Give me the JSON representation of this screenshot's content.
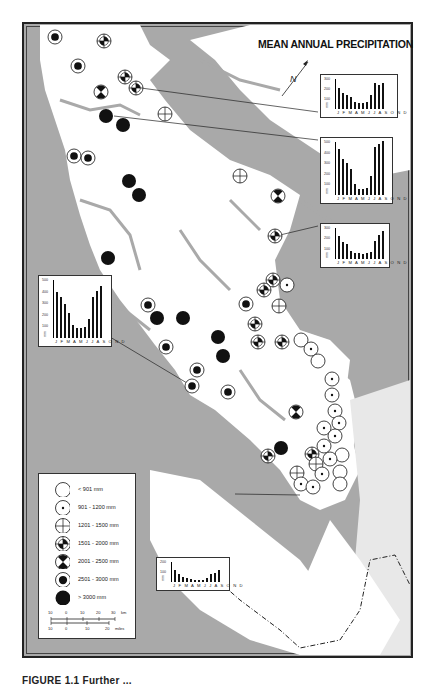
{
  "map": {
    "title": "MEAN ANNUAL PRECIPITATION",
    "caption": "FIGURE 1.1 Further ...",
    "north_arrow": "N",
    "colors": {
      "land": "#ffffff",
      "water": "#a9a9a9",
      "ink": "#111111"
    }
  },
  "legend": {
    "items": [
      {
        "symbol": "open-circle",
        "label": "< 901 mm"
      },
      {
        "symbol": "dot-circle",
        "label": "901 - 1200 mm"
      },
      {
        "symbol": "crosshair-circle",
        "label": "1201 - 1500 mm"
      },
      {
        "symbol": "quadrant-circle",
        "label": "1501 - 2000 mm"
      },
      {
        "symbol": "hourglass-circle",
        "label": "2001 - 2500 mm"
      },
      {
        "symbol": "ring-filled-circle",
        "label": "2501 - 3000 mm"
      },
      {
        "symbol": "solid-circle",
        "label": "> 3000 mm"
      }
    ],
    "scale": {
      "km_ticks": [
        "10",
        "0",
        "10",
        "20",
        "30"
      ],
      "km_unit": "km",
      "mile_ticks": [
        "10",
        "0",
        "10",
        "20"
      ],
      "mile_unit": "miles"
    }
  },
  "chart_data": [
    {
      "type": "bar",
      "title": "Climograph 1 (north coast station)",
      "categories": [
        "J",
        "F",
        "M",
        "A",
        "M",
        "J",
        "J",
        "A",
        "S",
        "O",
        "N",
        "D"
      ],
      "values": [
        210,
        160,
        140,
        120,
        70,
        65,
        60,
        70,
        140,
        260,
        240,
        265
      ],
      "ylabel": "mm",
      "yticks": [
        "100",
        "200",
        "300"
      ],
      "ylim": [
        0,
        300
      ],
      "month_labels": "J F M A M J J A S O N D"
    },
    {
      "type": "bar",
      "title": "Climograph 2 (exposed coast station)",
      "categories": [
        "J",
        "F",
        "M",
        "A",
        "M",
        "J",
        "J",
        "A",
        "S",
        "O",
        "N",
        "D"
      ],
      "values": [
        430,
        340,
        300,
        250,
        100,
        60,
        60,
        70,
        180,
        450,
        480,
        510
      ],
      "ylabel": "mm",
      "yticks": [
        "100",
        "200",
        "300",
        "400",
        "500"
      ],
      "ylim": [
        0,
        500
      ],
      "month_labels": "J F M A M J J A S O N D"
    },
    {
      "type": "bar",
      "title": "Climograph 3 (inner coast station)",
      "categories": [
        "J",
        "F",
        "M",
        "A",
        "M",
        "J",
        "J",
        "A",
        "S",
        "O",
        "N",
        "D"
      ],
      "values": [
        225,
        165,
        145,
        80,
        60,
        60,
        45,
        55,
        65,
        170,
        235,
        270
      ],
      "ylabel": "mm",
      "yticks": [
        "100",
        "200",
        "300"
      ],
      "ylim": [
        0,
        300
      ],
      "month_labels": "J F M A M J J A S O N D"
    },
    {
      "type": "bar",
      "title": "Climograph 4 (west coast station)",
      "categories": [
        "J",
        "F",
        "M",
        "A",
        "M",
        "J",
        "J",
        "A",
        "S",
        "O",
        "N",
        "D"
      ],
      "values": [
        400,
        350,
        290,
        215,
        110,
        90,
        85,
        95,
        160,
        350,
        405,
        445
      ],
      "ylabel": "mm",
      "yticks": [
        "100",
        "200",
        "300",
        "400",
        "500"
      ],
      "ylim": [
        0,
        500
      ],
      "month_labels": "J F M A M J J A S O N D"
    },
    {
      "type": "bar",
      "title": "Climograph 5 (southeast station)",
      "categories": [
        "J",
        "F",
        "M",
        "A",
        "M",
        "J",
        "J",
        "A",
        "S",
        "O",
        "N",
        "D"
      ],
      "values": [
        120,
        80,
        55,
        40,
        30,
        25,
        20,
        25,
        45,
        80,
        95,
        120
      ],
      "ylabel": "mm",
      "yticks": [
        "100",
        "200"
      ],
      "ylim": [
        0,
        200
      ],
      "month_labels": "J F M A M J J A S O N D"
    }
  ],
  "stations": [
    {
      "x": 55,
      "y": 37,
      "cls": "ring"
    },
    {
      "x": 104,
      "y": 41,
      "cls": "quad"
    },
    {
      "x": 78,
      "y": 66,
      "cls": "ring"
    },
    {
      "x": 125,
      "y": 77,
      "cls": "quad"
    },
    {
      "x": 136,
      "y": 88,
      "cls": "quad"
    },
    {
      "x": 101,
      "y": 92,
      "cls": "hour"
    },
    {
      "x": 106,
      "y": 116,
      "cls": "solid"
    },
    {
      "x": 123,
      "y": 125,
      "cls": "solid"
    },
    {
      "x": 165,
      "y": 114,
      "cls": "cross"
    },
    {
      "x": 74,
      "y": 156,
      "cls": "ring"
    },
    {
      "x": 88,
      "y": 158,
      "cls": "ring"
    },
    {
      "x": 129,
      "y": 181,
      "cls": "solid"
    },
    {
      "x": 139,
      "y": 195,
      "cls": "solid"
    },
    {
      "x": 240,
      "y": 176,
      "cls": "cross"
    },
    {
      "x": 278,
      "y": 196,
      "cls": "hour"
    },
    {
      "x": 275,
      "y": 236,
      "cls": "quad"
    },
    {
      "x": 108,
      "y": 258,
      "cls": "solid"
    },
    {
      "x": 273,
      "y": 280,
      "cls": "quad"
    },
    {
      "x": 287,
      "y": 285,
      "cls": "dot"
    },
    {
      "x": 264,
      "y": 290,
      "cls": "quad"
    },
    {
      "x": 148,
      "y": 305,
      "cls": "ring"
    },
    {
      "x": 246,
      "y": 304,
      "cls": "ring"
    },
    {
      "x": 279,
      "y": 306,
      "cls": "cross"
    },
    {
      "x": 157,
      "y": 318,
      "cls": "solid"
    },
    {
      "x": 183,
      "y": 318,
      "cls": "solid"
    },
    {
      "x": 255,
      "y": 324,
      "cls": "quad"
    },
    {
      "x": 218,
      "y": 337,
      "cls": "solid"
    },
    {
      "x": 258,
      "y": 342,
      "cls": "quad"
    },
    {
      "x": 282,
      "y": 342,
      "cls": "quad"
    },
    {
      "x": 301,
      "y": 340,
      "cls": "open"
    },
    {
      "x": 166,
      "y": 347,
      "cls": "ring"
    },
    {
      "x": 223,
      "y": 356,
      "cls": "solid"
    },
    {
      "x": 311,
      "y": 349,
      "cls": "dot"
    },
    {
      "x": 318,
      "y": 361,
      "cls": "open"
    },
    {
      "x": 197,
      "y": 370,
      "cls": "ring"
    },
    {
      "x": 332,
      "y": 379,
      "cls": "dot"
    },
    {
      "x": 192,
      "y": 386,
      "cls": "ring"
    },
    {
      "x": 228,
      "y": 392,
      "cls": "ring"
    },
    {
      "x": 332,
      "y": 395,
      "cls": "dot"
    },
    {
      "x": 335,
      "y": 411,
      "cls": "dot"
    },
    {
      "x": 296,
      "y": 412,
      "cls": "hour"
    },
    {
      "x": 339,
      "y": 423,
      "cls": "dot"
    },
    {
      "x": 324,
      "y": 428,
      "cls": "dot"
    },
    {
      "x": 335,
      "y": 436,
      "cls": "dot"
    },
    {
      "x": 324,
      "y": 446,
      "cls": "dot"
    },
    {
      "x": 281,
      "y": 448,
      "cls": "solid"
    },
    {
      "x": 268,
      "y": 456,
      "cls": "quad"
    },
    {
      "x": 312,
      "y": 454,
      "cls": "quad"
    },
    {
      "x": 342,
      "y": 455,
      "cls": "open"
    },
    {
      "x": 330,
      "y": 459,
      "cls": "dot"
    },
    {
      "x": 316,
      "y": 464,
      "cls": "cross"
    },
    {
      "x": 340,
      "y": 472,
      "cls": "open"
    },
    {
      "x": 297,
      "y": 473,
      "cls": "cross"
    },
    {
      "x": 322,
      "y": 474,
      "cls": "dot"
    },
    {
      "x": 301,
      "y": 484,
      "cls": "dot"
    },
    {
      "x": 313,
      "y": 487,
      "cls": "dot"
    },
    {
      "x": 340,
      "y": 484,
      "cls": "open"
    }
  ]
}
